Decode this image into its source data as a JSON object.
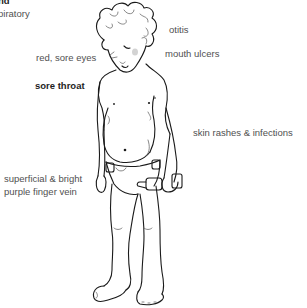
{
  "diagram": {
    "labels": {
      "top_left_bold_cut": "nd",
      "top_left_cut": "piratory",
      "red_sore_eyes": "red, sore eyes",
      "sore_throat": "sore throat",
      "otitis": "otitis",
      "mouth_ulcers": "mouth ulcers",
      "skin_rashes": "skin rashes & infections",
      "finger_vein_line1": "superficial & bright",
      "finger_vein_line2": "purple finger vein"
    },
    "colors": {
      "text": "#505050",
      "bold_text": "#1e1e1e",
      "line": "#1a1a1a",
      "background": "#ffffff"
    }
  }
}
